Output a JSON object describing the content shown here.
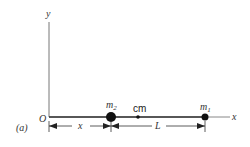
{
  "figure": {
    "panel_label": "(a)",
    "origin_label": "O",
    "x_axis_label": "x",
    "y_axis_label": "y",
    "masses": [
      {
        "label_base": "m",
        "label_sub": "2",
        "x": 111,
        "y": 117,
        "radius": 5
      },
      {
        "label_base": "m",
        "label_sub": "1",
        "x": 205,
        "y": 117,
        "radius": 3.5
      }
    ],
    "center_of_mass": {
      "label": "cm",
      "x": 138,
      "y": 117
    },
    "dimensions": [
      {
        "label": "x",
        "from": "O",
        "to": "m2"
      },
      {
        "label": "L",
        "from": "m2",
        "to": "m1"
      }
    ],
    "colors": {
      "line": "#333333",
      "mass": "#111111",
      "axis": "#888888"
    }
  }
}
